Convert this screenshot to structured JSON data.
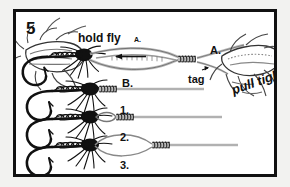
{
  "figure": {
    "step_number": "5",
    "caption_absent": true,
    "border_color": "#111111",
    "page_color": "#f2f2f0",
    "panel_color": "#ffffff",
    "ink_color": "#111111",
    "leader_color": "#b9b9b9"
  },
  "labels": {
    "hold_fly": "hold fly",
    "hold_fly_point": "A.",
    "point_a": "A.",
    "point_b": "B.",
    "tag": "tag",
    "pull_tight": "pull tight",
    "stage_1": "1.",
    "stage_2": "2.",
    "stage_3": "3."
  },
  "scene": {
    "title_absent": true,
    "elements": [
      "left-hand-holding-fly",
      "right-hand-pulling-leader",
      "artificial-fly-with-hook",
      "leader-loop",
      "coiled-knot-wraps",
      "direction-arrow-left",
      "tag-end-pointer"
    ],
    "stages": [
      {
        "label": "1.",
        "description": "fly with finished knot tight to hook eye"
      },
      {
        "label": "2.",
        "description": "fly with small loop before knot"
      },
      {
        "label": "3.",
        "description": "fly with large open loop and knot coils"
      }
    ]
  }
}
